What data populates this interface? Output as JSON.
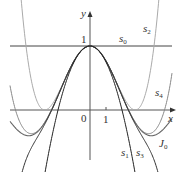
{
  "chart_data": {
    "type": "line",
    "title": "",
    "xlabel": "x",
    "ylabel": "y",
    "x_ticks": [
      "0",
      "1"
    ],
    "y_ticks": [
      "1"
    ],
    "xlim": [
      -5.5,
      5.5
    ],
    "ylim": [
      -1.0,
      1.6
    ],
    "series": [
      {
        "name": "s0",
        "formula": "1"
      },
      {
        "name": "s1",
        "formula": "1 - x^2/4"
      },
      {
        "name": "s2",
        "formula": "1 - x^2/4 + x^4/64"
      },
      {
        "name": "s3",
        "formula": "1 - x^2/4 + x^4/64 - x^6/2304"
      },
      {
        "name": "s4",
        "formula": "1 - x^2/4 + x^4/64 - x^6/2304 + x^8/147456"
      },
      {
        "name": "J0",
        "formula": "Bessel function of the first kind, order 0"
      }
    ]
  },
  "labels": {
    "y_axis": "y",
    "x_axis": "x",
    "origin": "0",
    "x_tick_1": "1",
    "y_tick_1": "1",
    "s0": "s",
    "s0_sub": "0",
    "s1": "s",
    "s1_sub": "1",
    "s2": "s",
    "s2_sub": "2",
    "s3": "s",
    "s3_sub": "3",
    "s4": "s",
    "s4_sub": "4",
    "J0": "J",
    "J0_sub": "0"
  }
}
